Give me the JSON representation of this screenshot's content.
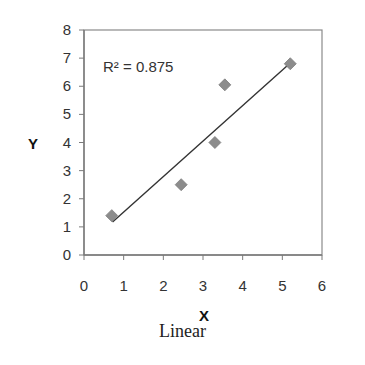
{
  "chart_data": {
    "type": "scatter",
    "title": "",
    "caption": "Linear",
    "xlabel": "X",
    "ylabel": "Y",
    "xlim": [
      0,
      6
    ],
    "ylim": [
      0,
      8
    ],
    "xticks": [
      0,
      1,
      2,
      3,
      4,
      5,
      6
    ],
    "yticks": [
      0,
      1,
      2,
      3,
      4,
      5,
      6,
      7,
      8
    ],
    "grid": false,
    "legend": null,
    "series": [
      {
        "name": "data",
        "marker": "diamond",
        "color": "#8c8c8c",
        "points": [
          {
            "x": 0.7,
            "y": 1.4
          },
          {
            "x": 2.45,
            "y": 2.5
          },
          {
            "x": 3.3,
            "y": 4.0
          },
          {
            "x": 3.55,
            "y": 6.05
          },
          {
            "x": 5.2,
            "y": 6.8
          }
        ]
      }
    ],
    "trendline": {
      "type": "linear",
      "color": "#333333",
      "x_start": 0.72,
      "y_start": 1.17,
      "x_end": 5.2,
      "y_end": 6.83
    },
    "annotations": [
      {
        "text": "R² = 0.875",
        "x": 0.5,
        "y": 6.6
      }
    ]
  }
}
